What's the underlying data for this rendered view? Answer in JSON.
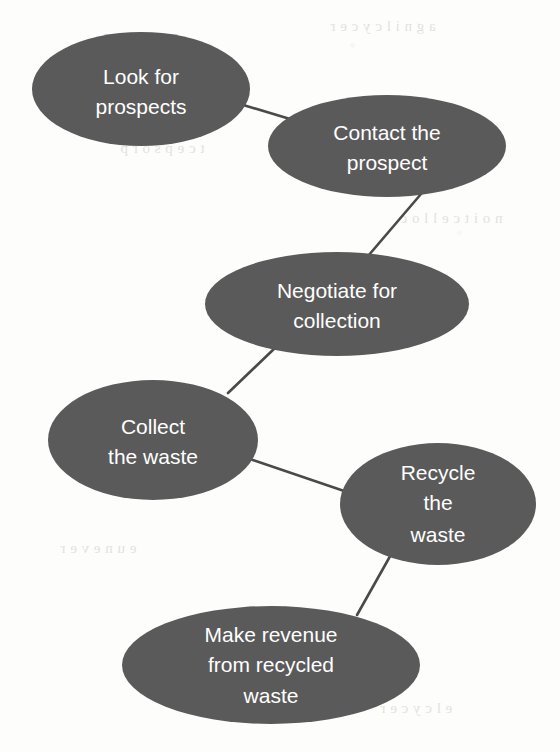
{
  "diagram": {
    "background_color": "#fdfdfb",
    "node_fill_color": "#5a5a5a",
    "node_text_color": "#ffffff",
    "connector_color": "#4a4a4a",
    "nodes": [
      {
        "id": "look-for-prospects",
        "label": "Look for prospects",
        "lines": [
          "Look for",
          "prospects"
        ],
        "cx": 141,
        "cy": 89,
        "rx": 109,
        "ry": 57
      },
      {
        "id": "contact-the-prospect",
        "label": "Contact the prospect",
        "lines": [
          "Contact the",
          "prospect"
        ],
        "cx": 387,
        "cy": 146,
        "rx": 119,
        "ry": 51
      },
      {
        "id": "negotiate-for-collection",
        "label": "Negotiate for collection",
        "lines": [
          "Negotiate for",
          "collection"
        ],
        "cx": 337,
        "cy": 304,
        "rx": 132,
        "ry": 52
      },
      {
        "id": "collect-the-waste",
        "label": "Collect the waste",
        "lines": [
          "Collect",
          "the waste"
        ],
        "cx": 153,
        "cy": 440,
        "rx": 105,
        "ry": 60
      },
      {
        "id": "recycle-the-waste",
        "label": "Recycle the waste",
        "lines": [
          "Recycle",
          "the",
          "waste"
        ],
        "cx": 438,
        "cy": 504,
        "rx": 98,
        "ry": 61
      },
      {
        "id": "make-revenue-from-recycled-waste",
        "label": "Make revenue from recycled waste",
        "lines": [
          "Make revenue",
          "from recycled",
          "waste"
        ],
        "cx": 271,
        "cy": 665,
        "rx": 149,
        "ry": 59
      }
    ],
    "connectors": [
      {
        "id": "look-to-contact",
        "from": "look-for-prospects",
        "to": "contact-the-prospect",
        "x1": 240,
        "y1": 104,
        "x2": 300,
        "y2": 122
      },
      {
        "id": "contact-to-negotiate",
        "from": "contact-the-prospect",
        "to": "negotiate-for-collection",
        "x1": 421,
        "y1": 194,
        "x2": 368,
        "y2": 256
      },
      {
        "id": "negotiate-to-collect",
        "from": "negotiate-for-collection",
        "to": "collect-the-waste",
        "x1": 276,
        "y1": 347,
        "x2": 228,
        "y2": 393
      },
      {
        "id": "collect-to-recycle",
        "from": "collect-the-waste",
        "to": "recycle-the-waste",
        "x1": 250,
        "y1": 459,
        "x2": 350,
        "y2": 493
      },
      {
        "id": "recycle-to-revenue",
        "from": "recycle-the-waste",
        "to": "make-revenue-from-recycled-waste",
        "x1": 393,
        "y1": 551,
        "x2": 357,
        "y2": 615
      }
    ]
  }
}
